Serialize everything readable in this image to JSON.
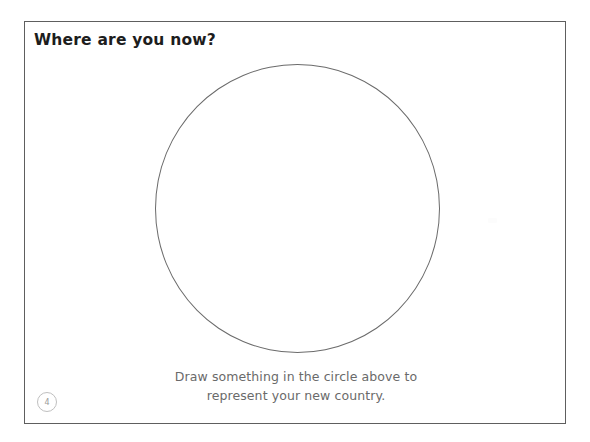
{
  "document": {
    "type": "worksheet-page",
    "background_color": "#ffffff",
    "frame_border_color": "#5e5e5e"
  },
  "header": {
    "title": "Where are you now?",
    "title_color": "#1d1d1d"
  },
  "drawing_area": {
    "shape_name": "empty-circle",
    "outline_color": "#6b6b6b",
    "fill": "none"
  },
  "caption": {
    "line1": "Draw something in the circle above to",
    "line2": "represent your new country.",
    "color": "#6a6a6a"
  },
  "footer": {
    "page_number": "4",
    "page_number_color": "#9a9a9a",
    "badge_border_color": "#bfbfbf"
  }
}
